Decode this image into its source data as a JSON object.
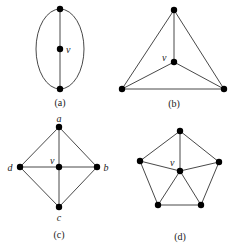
{
  "figure": {
    "panels": [
      {
        "id": "a",
        "caption": "(a)",
        "vertex_label": "v",
        "description": "Two vertices joined by two curved edges (ellipse) and a straight edge through central vertex v"
      },
      {
        "id": "b",
        "caption": "(b)",
        "vertex_label": "v",
        "description": "Triangle with central vertex v connected to all three corners (K4)"
      },
      {
        "id": "c",
        "caption": "(c)",
        "vertex_label": "v",
        "outer_labels": {
          "top": "a",
          "right": "b",
          "bottom": "c",
          "left": "d"
        },
        "description": "Diamond a-b-c-d with central vertex v connected to all four (wheel W4)"
      },
      {
        "id": "d",
        "caption": "(d)",
        "vertex_label": "v",
        "description": "Pentagon with central vertex v connected to all five outer vertices (wheel W5)"
      }
    ],
    "colors": {
      "node": "#000000",
      "edge": "#333333",
      "text": "#222222",
      "background": "#ffffff"
    }
  }
}
